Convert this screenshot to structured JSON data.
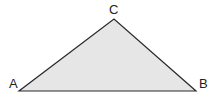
{
  "diagram": {
    "type": "triangle",
    "fill": "#e6e6e6",
    "stroke": "#2a2a2a",
    "vertices": [
      {
        "label": "A",
        "x": 19,
        "y": 91
      },
      {
        "label": "B",
        "x": 196,
        "y": 91
      },
      {
        "label": "C",
        "x": 114,
        "y": 19
      }
    ]
  }
}
